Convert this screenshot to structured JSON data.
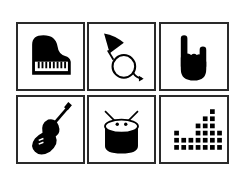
{
  "grid": {
    "rows": 2,
    "columns": 3,
    "border_color": "#2a2a2a",
    "icon_color": "#000000",
    "background": "#ffffff",
    "tiles": [
      {
        "icon": "grand-piano-icon",
        "label": "Piano"
      },
      {
        "icon": "french-horn-icon",
        "label": "French horn"
      },
      {
        "icon": "rock-hand-icon",
        "label": "Rock hand"
      },
      {
        "icon": "guitar-icon",
        "label": "Guitar"
      },
      {
        "icon": "drum-icon",
        "label": "Drum"
      },
      {
        "icon": "equalizer-icon",
        "label": "Equalizer"
      }
    ],
    "equalizer_columns": [
      3,
      2,
      2,
      4,
      5,
      6,
      3
    ]
  }
}
